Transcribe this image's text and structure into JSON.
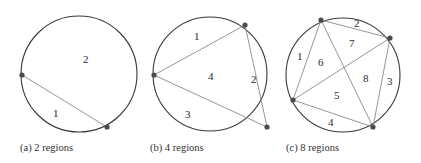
{
  "figures": [
    {
      "id": "a",
      "caption": "(a) 2 regions",
      "region_labels": [
        "1",
        "2"
      ]
    },
    {
      "id": "b",
      "caption": "(b) 4 regions",
      "region_labels": [
        "1",
        "2",
        "3",
        "4"
      ]
    },
    {
      "id": "c",
      "caption": "(c) 8 regions",
      "region_labels": [
        "1",
        "2",
        "3",
        "4",
        "5",
        "6",
        "7",
        "8"
      ]
    }
  ]
}
